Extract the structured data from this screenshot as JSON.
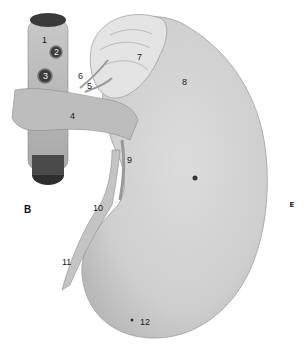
{
  "figure": {
    "panel_label": "B",
    "side_label": [
      "L",
      "E",
      "F",
      "T"
    ],
    "labels": [
      {
        "id": "1",
        "text": "1",
        "x": 42,
        "y": 36
      },
      {
        "id": "2",
        "text": "2",
        "x": 54,
        "y": 50
      },
      {
        "id": "3",
        "text": "3",
        "x": 44,
        "y": 75
      },
      {
        "id": "4",
        "text": "4",
        "x": 70,
        "y": 112
      },
      {
        "id": "5",
        "text": "5",
        "x": 87,
        "y": 83
      },
      {
        "id": "6",
        "text": "6",
        "x": 77,
        "y": 73
      },
      {
        "id": "7",
        "text": "7",
        "x": 136,
        "y": 54
      },
      {
        "id": "8",
        "text": "8",
        "x": 180,
        "y": 78
      },
      {
        "id": "9",
        "text": "9",
        "x": 126,
        "y": 155
      },
      {
        "id": "10",
        "text": "10",
        "x": 93,
        "y": 204
      },
      {
        "id": "11",
        "text": "11",
        "x": 62,
        "y": 259
      },
      {
        "id": "12",
        "text": "12",
        "x": 139,
        "y": 318
      }
    ]
  }
}
